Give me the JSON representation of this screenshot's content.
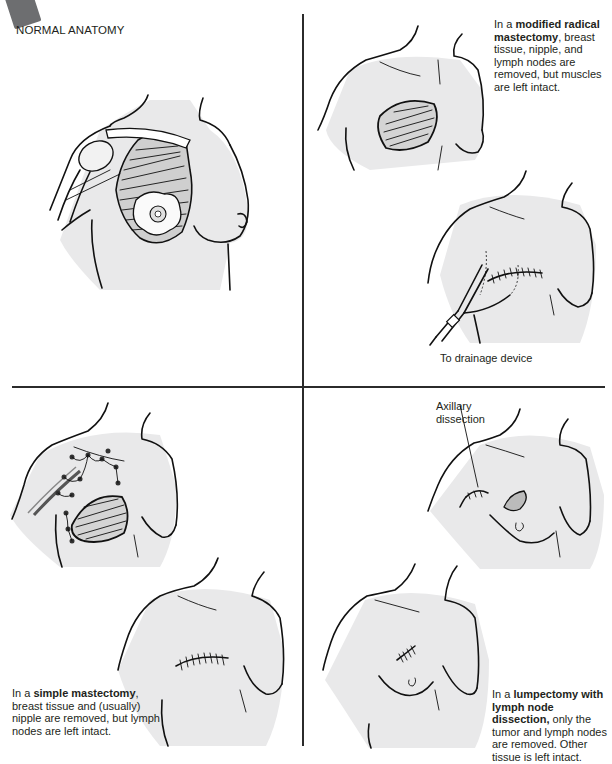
{
  "figure": {
    "section_title": "NORMAL ANATOMY",
    "panels": [
      {
        "id": "normal-anatomy",
        "position": "top-left",
        "title": "NORMAL ANATOMY",
        "illustration": "chest-normal-anatomy"
      },
      {
        "id": "modified-radical-mastectomy",
        "position": "top-right",
        "caption_prefix": "In a ",
        "caption_bold": "modified radical mastectomy",
        "caption_rest": ", breast tissue, nipple, and lymph nodes are removed, but muscles are left intact.",
        "labels": {
          "drainage": "To drainage device"
        }
      },
      {
        "id": "simple-mastectomy",
        "position": "bottom-left",
        "caption_prefix": "In a ",
        "caption_bold": "simple mastectomy",
        "caption_rest": ", breast tissue and (usually) nipple are removed, but lymph nodes are left intact."
      },
      {
        "id": "lumpectomy",
        "position": "bottom-right",
        "caption_prefix": "In a ",
        "caption_bold": "lumpectomy with lymph node dissection,",
        "caption_rest": " only the tumor and lymph nodes are removed. Other tissue is left intact.",
        "labels": {
          "axillary": "Axillary dissection"
        }
      }
    ]
  },
  "colors": {
    "ink": "#111111",
    "skin_shade": "#e9e9ea",
    "tag": "#6d6e70",
    "divider": "#2b2b2b"
  }
}
